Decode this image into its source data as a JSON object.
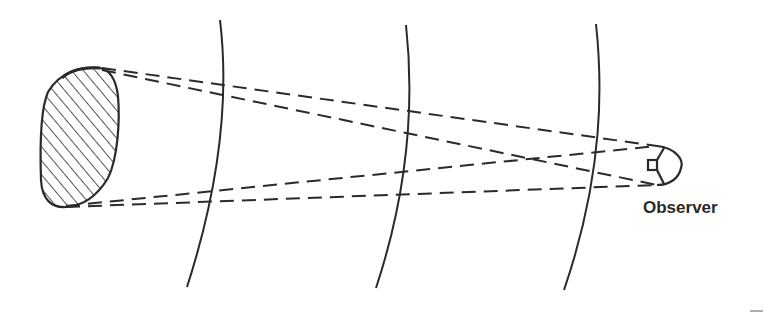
{
  "figure": {
    "observer_label": "Observer",
    "ink_color": "#2a2a2a",
    "background": "#ffffff",
    "elements": {
      "source_object": "hatched-blob",
      "wavefronts": 3,
      "ray_lines": 4,
      "ray_style": "dashed"
    }
  }
}
